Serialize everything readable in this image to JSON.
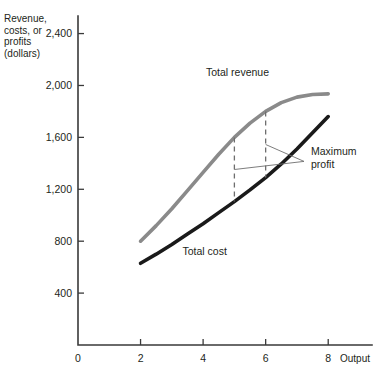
{
  "chart_data": {
    "type": "line",
    "title": "",
    "xlabel": "Output",
    "ylabel": "Revenue, costs, or profits (dollars)",
    "ylabel_lines": [
      "Revenue,",
      "costs, or",
      "profits",
      "(dollars)"
    ],
    "xlim": [
      0,
      9.4
    ],
    "ylim": [
      0,
      2520
    ],
    "xticks": [
      0,
      2,
      4,
      6,
      8
    ],
    "xtick_labels": [
      "0",
      "2",
      "4",
      "6",
      "8"
    ],
    "yticks": [
      400,
      800,
      1200,
      1600,
      2000,
      2400
    ],
    "ytick_labels": [
      "400",
      "800",
      "1,200",
      "1,600",
      "2,000",
      "2,400"
    ],
    "grid": false,
    "legend": "inline-labels",
    "series": [
      {
        "name": "Total revenue",
        "color": "#8a8a8a",
        "label": "Total revenue",
        "label_x": 5.1,
        "label_y": 2075,
        "x": [
          2,
          2.5,
          3,
          3.5,
          4,
          4.5,
          5,
          5.5,
          6,
          6.5,
          7,
          7.5,
          8
        ],
        "y": [
          800,
          920,
          1050,
          1190,
          1330,
          1470,
          1600,
          1710,
          1800,
          1868,
          1910,
          1930,
          1935
        ]
      },
      {
        "name": "Total cost",
        "color": "#1a1a1a",
        "label": "Total cost",
        "label_x": 4.05,
        "label_y": 690,
        "x": [
          2,
          2.5,
          3,
          3.5,
          4,
          4.5,
          5,
          5.5,
          6,
          6.5,
          7,
          7.5,
          8
        ],
        "y": [
          630,
          700,
          775,
          855,
          935,
          1020,
          1105,
          1195,
          1290,
          1395,
          1510,
          1635,
          1760
        ]
      }
    ],
    "annotations": [
      {
        "name": "maximum-profit",
        "text_lines": [
          "Maximum",
          "profit"
        ],
        "text_x": 7.45,
        "text_y": 1430,
        "markers_x": [
          5,
          6
        ],
        "marker_top_y": [
          1600,
          1800
        ],
        "marker_bottom_y": [
          1105,
          1290
        ]
      }
    ]
  }
}
